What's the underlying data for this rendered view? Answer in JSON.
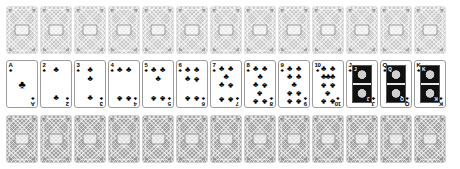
{
  "scene": {
    "title": "Playing card deck display",
    "background_color": "#ffffff",
    "card_count_total": 39,
    "rows": 3,
    "columns": 13
  },
  "suit": {
    "name": "clubs",
    "glyph": "♣",
    "color": "#000000"
  },
  "rows": [
    {
      "id": "top-row",
      "name": "face-down-row-top",
      "type": "backs",
      "count": 13,
      "back_color": "#c9c9c9",
      "shade": "light"
    },
    {
      "id": "middle-row",
      "name": "face-up-row",
      "type": "faces",
      "count": 13
    },
    {
      "id": "bottom-row",
      "name": "face-down-row-bottom",
      "type": "backs",
      "count": 13,
      "back_color": "#a2a2a2",
      "shade": "dark"
    }
  ],
  "faces": [
    {
      "rank": "A",
      "label": "Ace of Clubs",
      "pips": 1,
      "layout": "A",
      "court": false
    },
    {
      "rank": "2",
      "label": "Two of Clubs",
      "pips": 2,
      "layout": "2",
      "court": false
    },
    {
      "rank": "3",
      "label": "Three of Clubs",
      "pips": 3,
      "layout": "3",
      "court": false
    },
    {
      "rank": "4",
      "label": "Four of Clubs",
      "pips": 4,
      "layout": "4",
      "court": false
    },
    {
      "rank": "5",
      "label": "Five of Clubs",
      "pips": 5,
      "layout": "5",
      "court": false
    },
    {
      "rank": "6",
      "label": "Six of Clubs",
      "pips": 6,
      "layout": "6",
      "court": false
    },
    {
      "rank": "7",
      "label": "Seven of Clubs",
      "pips": 7,
      "layout": "7",
      "court": false
    },
    {
      "rank": "8",
      "label": "Eight of Clubs",
      "pips": 8,
      "layout": "8",
      "court": false
    },
    {
      "rank": "9",
      "label": "Nine of Clubs",
      "pips": 9,
      "layout": "9",
      "court": false
    },
    {
      "rank": "10",
      "label": "Ten of Clubs",
      "pips": 10,
      "layout": "10",
      "court": false
    },
    {
      "rank": "J",
      "label": "Jack of Clubs",
      "pips": 0,
      "layout": "court",
      "court": true
    },
    {
      "rank": "Q",
      "label": "Queen of Clubs",
      "pips": 0,
      "layout": "court",
      "court": true
    },
    {
      "rank": "K",
      "label": "King of Clubs",
      "pips": 0,
      "layout": "court",
      "court": true
    }
  ],
  "back_design": {
    "name": "lattice-back",
    "pattern": "diagonal-crosshatch",
    "has_center_medallion": true,
    "has_corner_wedges": true
  }
}
